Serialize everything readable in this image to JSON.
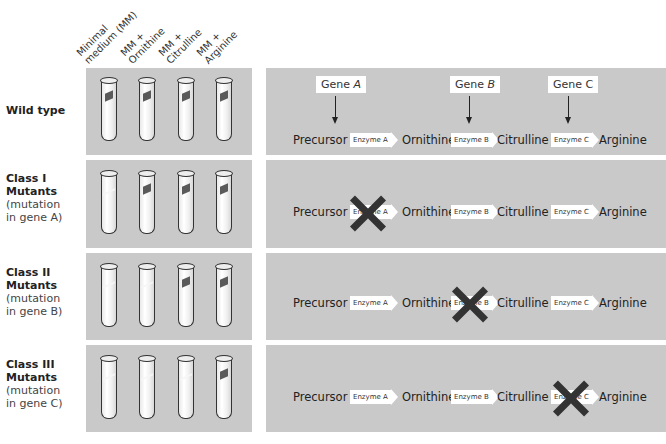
{
  "columns": [
    {
      "line1": "Minimal",
      "line2": "medium (MM)"
    },
    {
      "line1": "MM +",
      "line2": "Ornithine"
    },
    {
      "line1": "MM +",
      "line2": "Citrulline"
    },
    {
      "line1": "MM +",
      "line2": "Arginine"
    }
  ],
  "genes": [
    {
      "prefix": "Gene ",
      "letter": "A"
    },
    {
      "prefix": "Gene ",
      "letter": "B"
    },
    {
      "prefix": "Gene ",
      "letter": "C"
    }
  ],
  "pathway": {
    "compounds": [
      "Precursor",
      "Ornithine",
      "Citrulline",
      "Arginine"
    ],
    "enzymes": [
      "Enzyme A",
      "Enzyme B",
      "Enzyme C"
    ]
  },
  "rows": [
    {
      "title": "Wild type",
      "subtitle": "",
      "note1": "",
      "note2": "",
      "growth": [
        true,
        true,
        true,
        true
      ],
      "blocked_enzyme": null
    },
    {
      "title": "Class I",
      "subtitle": "Mutants",
      "note1": "(mutation",
      "note2": "in gene A)",
      "growth": [
        false,
        true,
        true,
        true
      ],
      "blocked_enzyme": 0
    },
    {
      "title": "Class II",
      "subtitle": "Mutants",
      "note1": "(mutation",
      "note2": "in gene B)",
      "growth": [
        false,
        false,
        true,
        true
      ],
      "blocked_enzyme": 1
    },
    {
      "title": "Class III",
      "subtitle": "Mutants",
      "note1": "(mutation",
      "note2": "in gene C)",
      "growth": [
        false,
        false,
        false,
        true
      ],
      "blocked_enzyme": 2
    }
  ],
  "colors": {
    "panel": "#c9c9c9",
    "growth": "#5a5a5a",
    "block_x": "#333333"
  }
}
